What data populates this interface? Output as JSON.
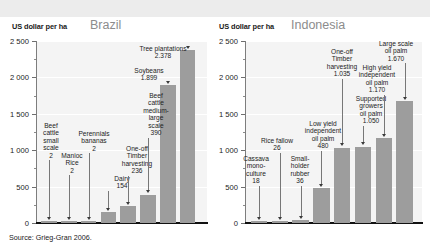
{
  "figure": {
    "source_note": "Source: Grieg-Gran 2006."
  },
  "panels": [
    {
      "country": "Brazil",
      "axis_title": "US dollar per ha"
    },
    {
      "country": "Indonesia",
      "axis_title": "US dollar per ha"
    }
  ],
  "y_axis": {
    "labels": [
      "2 500",
      "2 000",
      "1 500",
      "1 000",
      "500",
      "0"
    ],
    "min": 0,
    "max": 2500,
    "major_step": 500,
    "minor_step": 250
  },
  "chart_data": [
    {
      "type": "bar",
      "title": "Brazil",
      "xlabel": "",
      "ylabel": "US dollar per ha",
      "ylim": [
        0,
        2500
      ],
      "grid": true,
      "legend": "none",
      "categories": [
        "Beef cattle small scale",
        "Manioc Rice",
        "Perennials bananas",
        "Dairy",
        "One-off Timber harvesting",
        "Beef cattle medium-large scale",
        "Soybeans",
        "Tree plantations"
      ],
      "values": [
        2,
        2,
        2,
        154,
        236,
        390,
        1899,
        2378
      ],
      "value_labels": [
        "2",
        "2",
        "2",
        "154",
        "236",
        "390",
        "1.899",
        "2.378"
      ],
      "annotations": [
        "Beef\ncattle\nsmall\nscale\n2",
        "Manioc\nRice\n2",
        "Perennials\nbananas\n2",
        "Dairy\n154",
        "One-off\nTimber\nharvesting\n236",
        "Beef\ncattle\nmedium-\nlarge\nscale\n390",
        "Soybeans\n1.899",
        "Tree plantations\n2.378"
      ]
    },
    {
      "type": "bar",
      "title": "Indonesia",
      "xlabel": "",
      "ylabel": "US dollar per ha",
      "ylim": [
        0,
        2500
      ],
      "grid": true,
      "legend": "none",
      "categories": [
        "Cassava mono-culture",
        "Rice fallow",
        "Small-holder rubber",
        "Low yield independent oil palm",
        "One-off Timber harvesting",
        "Supported growers oil palm",
        "High yield independent oil palm",
        "Large scale oil palm"
      ],
      "values": [
        18,
        26,
        36,
        480,
        1035,
        1050,
        1170,
        1670
      ],
      "value_labels": [
        "18",
        "26",
        "36",
        "480",
        "1.035",
        "1.050",
        "1.170",
        "1.670"
      ],
      "annotations": [
        "Cassava\nmono-\nculture\n18",
        "Rice fallow\n26",
        "Small-\nholder\nrubber\n36",
        "Low yield\nindependent\noil palm\n480",
        "One-off\nTimber\nharvesting\n1.035",
        "Supported\ngrowers\noil palm\n1.050",
        "High yield\nindependent\noil palm\n1.170",
        "Large scale\noil palm\n1.670"
      ]
    }
  ],
  "colors": {
    "bar": "#9d9d9d",
    "plot_background": "#f4f4f4",
    "baseline": "#111111",
    "title_text": "#8c8c8c",
    "band": "#ececec"
  }
}
